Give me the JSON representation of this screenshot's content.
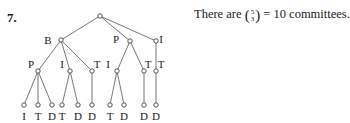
{
  "problem": {
    "number": "7.",
    "text_before": "There are",
    "binom_top": "5",
    "binom_bottom": "3",
    "text_after": "= 10 committees."
  },
  "tree": {
    "root": {
      "x": 100,
      "y": 16
    },
    "level1": [
      {
        "label": "B",
        "x": 61,
        "y": 40,
        "lx": 48,
        "ly": 44
      },
      {
        "label": "P",
        "x": 130,
        "y": 41,
        "lx": 116,
        "ly": 43
      },
      {
        "label": "I",
        "x": 156,
        "y": 41,
        "lx": 161,
        "ly": 43
      }
    ],
    "level2": [
      {
        "label": "P",
        "parent": 0,
        "x": 38,
        "y": 71,
        "lx": 31,
        "ly": 71
      },
      {
        "label": "I",
        "parent": 0,
        "x": 70,
        "y": 71,
        "lx": 62,
        "ly": 71
      },
      {
        "label": "T",
        "parent": 0,
        "x": 92,
        "y": 71,
        "lx": 97,
        "ly": 71
      },
      {
        "label": "I",
        "parent": 1,
        "x": 117,
        "y": 71,
        "lx": 108,
        "ly": 71
      },
      {
        "label": "T",
        "parent": 1,
        "x": 144,
        "y": 71,
        "lx": 148,
        "ly": 71
      },
      {
        "label": "T",
        "parent": 2,
        "x": 156,
        "y": 71,
        "lx": 161,
        "ly": 71
      }
    ],
    "leaves": [
      {
        "label": "I",
        "parent": 0,
        "x": 24
      },
      {
        "label": "T",
        "parent": 0,
        "x": 38
      },
      {
        "label": "D",
        "parent": 0,
        "x": 52
      },
      {
        "label": "T",
        "parent": 1,
        "x": 62
      },
      {
        "label": "D",
        "parent": 1,
        "x": 78
      },
      {
        "label": "D",
        "parent": 2,
        "x": 92
      },
      {
        "label": "T",
        "parent": 3,
        "x": 110
      },
      {
        "label": "D",
        "parent": 3,
        "x": 124
      },
      {
        "label": "D",
        "parent": 4,
        "x": 144
      },
      {
        "label": "D",
        "parent": 5,
        "x": 156
      }
    ],
    "leaf_node_y": 105,
    "leaf_label_y": 120,
    "colors": {
      "line": "#555555",
      "node": "#444444"
    }
  }
}
